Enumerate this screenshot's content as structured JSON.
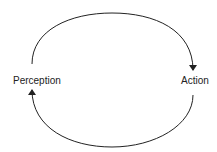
{
  "diagram": {
    "nodes": [
      {
        "id": "perception",
        "label": "Perception"
      },
      {
        "id": "action",
        "label": "Action"
      }
    ],
    "edges": [
      {
        "from": "perception",
        "to": "action",
        "path": "top-arc"
      },
      {
        "from": "action",
        "to": "perception",
        "path": "bottom-arc"
      }
    ],
    "colors": {
      "stroke": "#222222",
      "text": "#222222",
      "background": "#ffffff"
    }
  }
}
